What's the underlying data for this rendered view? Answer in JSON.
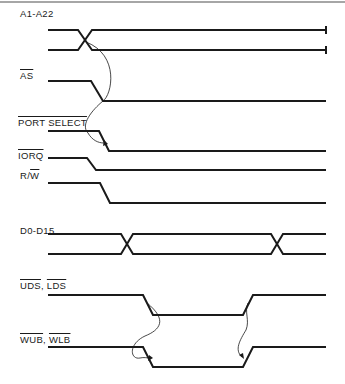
{
  "diagram": {
    "type": "timing-diagram",
    "signals": [
      {
        "id": "addr",
        "label": "A1-A22",
        "overline": false,
        "kind": "bus",
        "transitions": [
          "valid"
        ]
      },
      {
        "id": "as",
        "label": "AS",
        "overline": true,
        "kind": "falling"
      },
      {
        "id": "portsel",
        "label": "PORT SELECT",
        "overline": true,
        "kind": "falling"
      },
      {
        "id": "iorq",
        "label": "IORQ",
        "overline": true,
        "kind": "falling"
      },
      {
        "id": "rw",
        "label": "R/",
        "label_overline_part": "W",
        "kind": "falling"
      },
      {
        "id": "data",
        "label": "D0-D15",
        "overline": false,
        "kind": "bus",
        "transitions": [
          "valid",
          "invalid"
        ]
      },
      {
        "id": "uds",
        "label_a": "UDS",
        "label_sep": ", ",
        "label_b": "LDS",
        "overline": true,
        "kind": "pulse-low"
      },
      {
        "id": "wub",
        "label_a": "WUB",
        "label_sep": ", ",
        "label_b": "WLB",
        "overline": true,
        "kind": "pulse-low"
      }
    ],
    "causality": [
      {
        "from": "A1-A22",
        "to": "PORT SELECT"
      },
      {
        "from": "UDS, LDS falling",
        "to": "WUB, WLB falling"
      },
      {
        "from": "UDS, LDS rising",
        "to": "WUB, WLB rising"
      }
    ]
  }
}
